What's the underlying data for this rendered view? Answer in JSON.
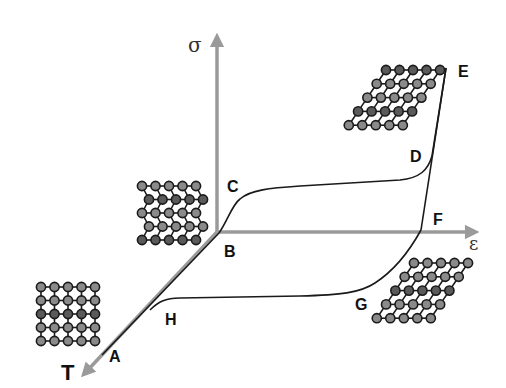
{
  "diagram": {
    "type": "shape-memory-alloy stress-strain-temperature cycle",
    "axes": {
      "stress": {
        "label": "σ",
        "color": "#9a9a9a"
      },
      "strain": {
        "label": "ε",
        "color": "#9a9a9a"
      },
      "temperature": {
        "label": "T",
        "color": "#9a9a9a"
      }
    },
    "points": {
      "A": "A",
      "B": "B",
      "C": "C",
      "D": "D",
      "E": "E",
      "F": "F",
      "G": "G",
      "H": "H"
    },
    "lattices": [
      {
        "name": "austenite-cubic-lattice",
        "shape": "square",
        "rows": 5,
        "cols": 5,
        "position": "near A"
      },
      {
        "name": "twinned-martensite-lattice",
        "shape": "twinned",
        "rows": 5,
        "cols": 5,
        "position": "near B/C"
      },
      {
        "name": "detwinned-martensite-lattice-loaded",
        "shape": "sheared",
        "rows": 5,
        "cols": 5,
        "position": "near D/E"
      },
      {
        "name": "detwinned-martensite-lattice-unloaded",
        "shape": "sheared",
        "rows": 5,
        "cols": 5,
        "position": "near F/G"
      }
    ],
    "colors": {
      "axis": "#9a9a9a",
      "curve": "#1a1a1a",
      "atom_light": "#8a8a8a",
      "atom_dark": "#5a5a5a",
      "atom_stroke": "#1a1a1a"
    }
  }
}
